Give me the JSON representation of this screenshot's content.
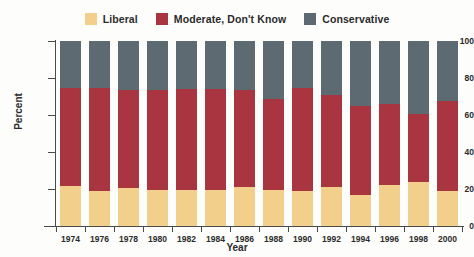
{
  "chart_data": {
    "type": "bar",
    "subtype": "stacked-percentage",
    "title": "",
    "xlabel": "Year",
    "ylabel": "Percent",
    "ylim": [
      0,
      100
    ],
    "yticks": [
      0,
      20,
      40,
      60,
      80,
      100
    ],
    "grid": false,
    "legend_position": "top-center",
    "categories": [
      "1974",
      "1976",
      "1978",
      "1980",
      "1982",
      "1984",
      "1986",
      "1988",
      "1990",
      "1992",
      "1994",
      "1996",
      "1998",
      "2000"
    ],
    "series": [
      {
        "name": "Liberal",
        "color": "#f2d08c",
        "values": [
          21.5,
          19.0,
          20.5,
          19.5,
          19.5,
          19.5,
          21.0,
          19.5,
          19.0,
          21.0,
          17.0,
          22.0,
          24.0,
          19.0
        ]
      },
      {
        "name": "Moderate, Don't Know",
        "color": "#a93540",
        "values": [
          53.0,
          55.5,
          53.0,
          54.0,
          54.5,
          54.5,
          52.5,
          49.0,
          55.5,
          50.0,
          48.0,
          44.0,
          36.5,
          48.5
        ]
      },
      {
        "name": "Conservative",
        "color": "#5e6a72",
        "values": [
          25.5,
          25.5,
          26.5,
          26.5,
          26.0,
          26.0,
          26.5,
          31.5,
          25.5,
          29.0,
          35.0,
          34.0,
          39.5,
          32.5
        ]
      }
    ]
  },
  "legend": {
    "entries": [
      {
        "label": "Liberal",
        "color": "#f2d08c",
        "swatch_name": "legend-swatch-liberal"
      },
      {
        "label": "Moderate, Don't Know",
        "color": "#a93540",
        "swatch_name": "legend-swatch-moderate"
      },
      {
        "label": "Conservative",
        "color": "#5e6a72",
        "swatch_name": "legend-swatch-conservative"
      }
    ]
  },
  "axes": {
    "y": {
      "label": "Percent",
      "ticks": [
        "0",
        "20",
        "40",
        "60",
        "80",
        "100"
      ]
    },
    "x": {
      "label": "Year"
    }
  }
}
